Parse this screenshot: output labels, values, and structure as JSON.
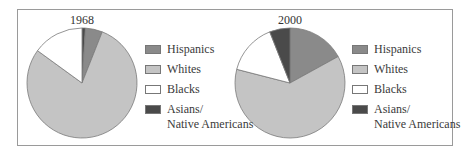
{
  "chart_data": [
    {
      "type": "pie",
      "title": "1968",
      "categories": [
        "Hispanics",
        "Whites",
        "Blacks",
        "Asians/ Native Americans"
      ],
      "values": [
        5,
        79,
        15,
        1
      ],
      "unit": "percent (estimated)",
      "start_angle": "12 o'clock, clockwise; Asians/Native Americans slice first",
      "legend_position": "right"
    },
    {
      "type": "pie",
      "title": "2000",
      "categories": [
        "Hispanics",
        "Whites",
        "Blacks",
        "Asians/ Native Americans"
      ],
      "values": [
        17,
        62,
        15,
        6
      ],
      "unit": "percent (estimated)",
      "start_angle": "12 o'clock, clockwise; Hispanics slice first",
      "legend_position": "right"
    }
  ],
  "colors": {
    "Hispanics": "#8a8a8a",
    "Whites": "#c4c4c4",
    "Blacks": "#ffffff",
    "Asians": "#4a4a4a",
    "border": "#7a7a7a"
  },
  "panels": [
    {
      "title": "1968",
      "legend": [
        {
          "label": "Hispanics"
        },
        {
          "label": "Whites"
        },
        {
          "label": "Blacks"
        },
        {
          "label": "Asians/",
          "label2": "Native Americans"
        }
      ]
    },
    {
      "title": "2000",
      "legend": [
        {
          "label": "Hispanics"
        },
        {
          "label": "Whites"
        },
        {
          "label": "Blacks"
        },
        {
          "label": "Asians/",
          "label2": "Native Americans"
        }
      ]
    }
  ]
}
